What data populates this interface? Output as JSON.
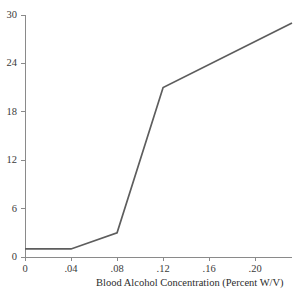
{
  "figure": {
    "background_color": "#ffffff",
    "artifact_text": "",
    "line_color": "#5d5d5d",
    "axis_color": "#8a8a8a",
    "tick_color": "#8a8a8a",
    "text_color": "#2b2b2b"
  },
  "chart_data": {
    "type": "line",
    "title": "",
    "xlabel": "Blood Alcohol Concentration (Percent W/V)",
    "ylabel": "",
    "xlim": [
      0,
      0.232
    ],
    "ylim": [
      0,
      30
    ],
    "grid": false,
    "legend": false,
    "xticks": [
      0,
      0.04,
      0.08,
      0.12,
      0.16,
      0.2
    ],
    "xtick_labels": [
      "0",
      ".04",
      ".08",
      ".12",
      ".16",
      ".20"
    ],
    "yticks": [
      0,
      6,
      12,
      18,
      24,
      30
    ],
    "ytick_labels": [
      "0",
      "6",
      "12",
      "18",
      "24",
      "30"
    ],
    "series": [
      {
        "name": "Relative Risk",
        "x": [
          0,
          0.04,
          0.08,
          0.12,
          0.232
        ],
        "values": [
          1,
          1,
          3,
          21,
          29
        ]
      }
    ]
  }
}
